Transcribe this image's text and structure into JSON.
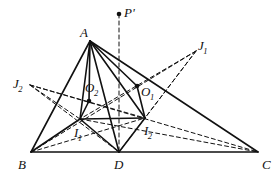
{
  "figure": {
    "type": "geometry-diagram",
    "width": 279,
    "height": 183,
    "background_color": "#ffffff",
    "stroke_color": "#111111",
    "solid_stroke_width": 1.6,
    "dashed_stroke_width": 1.0,
    "dash_pattern": "4,3"
  },
  "points": {
    "A": {
      "label": "A",
      "sub": "",
      "prime": "",
      "x": 90,
      "y": 41,
      "label_x": 80,
      "label_y": 26,
      "dot": false
    },
    "B": {
      "label": "B",
      "sub": "",
      "prime": "",
      "x": 31,
      "y": 152,
      "label_x": 18,
      "label_y": 158,
      "dot": false
    },
    "C": {
      "label": "C",
      "sub": "",
      "prime": "",
      "x": 258,
      "y": 152,
      "label_x": 262,
      "label_y": 158,
      "dot": false
    },
    "D": {
      "label": "D",
      "sub": "",
      "prime": "",
      "x": 119,
      "y": 152,
      "label_x": 114,
      "label_y": 158,
      "dot": false
    },
    "I1": {
      "label": "I",
      "sub": "1",
      "prime": "",
      "x": 80,
      "y": 119,
      "label_x": 74,
      "label_y": 126,
      "dot": false
    },
    "I2": {
      "label": "I",
      "sub": "2",
      "prime": "",
      "x": 145,
      "y": 118,
      "label_x": 144,
      "label_y": 124,
      "dot": false
    },
    "O1": {
      "label": "O",
      "sub": "1",
      "prime": "",
      "x": 137,
      "y": 86,
      "label_x": 141,
      "label_y": 85,
      "dot": true
    },
    "O2": {
      "label": "O",
      "sub": "2",
      "prime": "",
      "x": 89,
      "y": 101,
      "label_x": 85,
      "label_y": 81,
      "dot": true
    },
    "J1": {
      "label": "J",
      "sub": "1",
      "prime": "",
      "x": 196,
      "y": 51,
      "label_x": 198,
      "label_y": 39,
      "dot": false
    },
    "J2": {
      "label": "J",
      "sub": "2",
      "prime": "",
      "x": 30,
      "y": 85,
      "label_x": 13,
      "label_y": 77,
      "dot": false
    },
    "P": {
      "label": "P",
      "sub": "",
      "prime": "'",
      "x": 119,
      "y": 14,
      "label_x": 124,
      "label_y": 6,
      "dot": true
    }
  },
  "segments": {
    "solid": [
      {
        "name": "side-BC",
        "from": "B",
        "to": "C"
      },
      {
        "name": "side-AB",
        "from": "A",
        "to": "B"
      },
      {
        "name": "side-AC",
        "from": "A",
        "to": "C"
      },
      {
        "name": "cevian-AD",
        "from": "A",
        "to": "D"
      },
      {
        "name": "segment-A-I1",
        "from": "A",
        "to": "I1"
      },
      {
        "name": "segment-A-I2",
        "from": "A",
        "to": "I2"
      },
      {
        "name": "segment-A-O2",
        "from": "A",
        "to": "O2"
      },
      {
        "name": "segment-A-O1",
        "from": "A",
        "to": "O1"
      },
      {
        "name": "segment-O2-I1",
        "from": "O2",
        "to": "I1"
      },
      {
        "name": "segment-O1-I2",
        "from": "O1",
        "to": "I2"
      },
      {
        "name": "segment-I1-B",
        "from": "I1",
        "to": "B"
      },
      {
        "name": "segment-I1-D",
        "from": "I1",
        "to": "D"
      },
      {
        "name": "segment-I2-D",
        "from": "I2",
        "to": "D"
      },
      {
        "name": "segment-I1-I2",
        "from": "I1",
        "to": "I2"
      }
    ],
    "dashed": [
      {
        "name": "vertical-P-to-D",
        "from": "P",
        "to": "D"
      },
      {
        "name": "segment-J1-I2",
        "from": "J1",
        "to": "I2"
      },
      {
        "name": "segment-J1-I1",
        "from": "J1",
        "to": "I1"
      },
      {
        "name": "segment-J1-B",
        "from": "J1",
        "to": "B"
      },
      {
        "name": "segment-J1-D",
        "from": "J1",
        "to": "D"
      },
      {
        "name": "segment-J2-I1",
        "from": "J2",
        "to": "I1"
      },
      {
        "name": "segment-J2-I2",
        "from": "J2",
        "to": "I2"
      },
      {
        "name": "segment-J2-C",
        "from": "J2",
        "to": "C"
      },
      {
        "name": "segment-J2-D",
        "from": "J2",
        "to": "D"
      },
      {
        "name": "segment-I1-C",
        "from": "I1",
        "to": "C"
      },
      {
        "name": "segment-B-I2",
        "from": "B",
        "to": "I2"
      }
    ]
  }
}
